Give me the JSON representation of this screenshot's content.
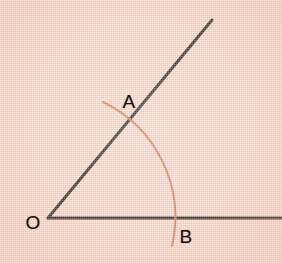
{
  "figure": {
    "width": 282,
    "height": 263,
    "background_color": "#f6d8cc",
    "ink_color": "#17110e",
    "arc_color": "#d4714f"
  },
  "labels": {
    "vertex": "O",
    "point_on_ray": "A",
    "point_on_baseline": "B"
  },
  "geometry": {
    "vertex": {
      "x": 48,
      "y": 218
    },
    "baseline_ray": {
      "from_x": 48,
      "from_y": 218,
      "to_x": 282,
      "to_y": 218
    },
    "diagonal_ray": {
      "from_x": 48,
      "from_y": 218,
      "to_x": 212,
      "to_y": 20
    },
    "angle_degrees": 50,
    "arc": {
      "center_x": 48,
      "center_y": 218,
      "radius": 128,
      "start_x": 103,
      "start_y": 102,
      "end_x": 172,
      "end_y": 246,
      "sweep_start_degrees": 65,
      "sweep_end_degrees": -12
    },
    "intersection_A": {
      "x": 131,
      "y": 121
    },
    "intersection_B": {
      "x": 176,
      "y": 218
    },
    "line_width": 3,
    "arc_width": 2
  }
}
